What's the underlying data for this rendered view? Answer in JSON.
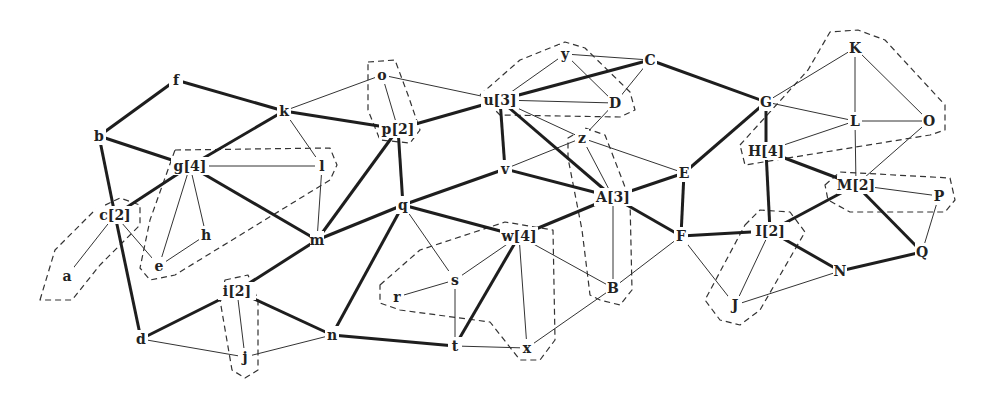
{
  "diagram": {
    "type": "graph",
    "nodes": [
      {
        "id": "f",
        "label": "f",
        "x": 176,
        "y": 80
      },
      {
        "id": "k",
        "label": "k",
        "x": 284,
        "y": 111
      },
      {
        "id": "b",
        "label": "b",
        "x": 99,
        "y": 136
      },
      {
        "id": "g",
        "label": "g[4]",
        "x": 190,
        "y": 166
      },
      {
        "id": "l",
        "label": "l",
        "x": 322,
        "y": 166
      },
      {
        "id": "c",
        "label": "c[2]",
        "x": 115,
        "y": 215
      },
      {
        "id": "h",
        "label": "h",
        "x": 206,
        "y": 235
      },
      {
        "id": "e",
        "label": "e",
        "x": 159,
        "y": 266
      },
      {
        "id": "a",
        "label": "a",
        "x": 67,
        "y": 276
      },
      {
        "id": "m",
        "label": "m",
        "x": 317,
        "y": 240
      },
      {
        "id": "i",
        "label": "i[2]",
        "x": 237,
        "y": 291
      },
      {
        "id": "d",
        "label": "d",
        "x": 141,
        "y": 339
      },
      {
        "id": "j",
        "label": "j",
        "x": 245,
        "y": 357
      },
      {
        "id": "n",
        "label": "n",
        "x": 332,
        "y": 335
      },
      {
        "id": "o",
        "label": "o",
        "x": 382,
        "y": 75
      },
      {
        "id": "p",
        "label": "p[2]",
        "x": 398,
        "y": 129
      },
      {
        "id": "q",
        "label": "q",
        "x": 403,
        "y": 205
      },
      {
        "id": "u",
        "label": "u[3]",
        "x": 500,
        "y": 100
      },
      {
        "id": "y",
        "label": "y",
        "x": 565,
        "y": 54
      },
      {
        "id": "C",
        "label": "C",
        "x": 650,
        "y": 60
      },
      {
        "id": "D",
        "label": "D",
        "x": 615,
        "y": 103
      },
      {
        "id": "z",
        "label": "z",
        "x": 582,
        "y": 138
      },
      {
        "id": "v",
        "label": "v",
        "x": 505,
        "y": 169
      },
      {
        "id": "A",
        "label": "A[3]",
        "x": 613,
        "y": 197
      },
      {
        "id": "E",
        "label": "E",
        "x": 684,
        "y": 173
      },
      {
        "id": "F",
        "label": "F",
        "x": 681,
        "y": 236
      },
      {
        "id": "w",
        "label": "w[4]",
        "x": 519,
        "y": 236
      },
      {
        "id": "s",
        "label": "s",
        "x": 455,
        "y": 280
      },
      {
        "id": "r",
        "label": "r",
        "x": 397,
        "y": 297
      },
      {
        "id": "t",
        "label": "t",
        "x": 455,
        "y": 346
      },
      {
        "id": "x",
        "label": "x",
        "x": 527,
        "y": 348
      },
      {
        "id": "B",
        "label": "B",
        "x": 613,
        "y": 288
      },
      {
        "id": "G",
        "label": "G",
        "x": 766,
        "y": 102
      },
      {
        "id": "K",
        "label": "K",
        "x": 855,
        "y": 48
      },
      {
        "id": "L",
        "label": "L",
        "x": 855,
        "y": 121
      },
      {
        "id": "O",
        "label": "O",
        "x": 929,
        "y": 121
      },
      {
        "id": "H",
        "label": "H[4]",
        "x": 766,
        "y": 151
      },
      {
        "id": "M",
        "label": "M[2]",
        "x": 856,
        "y": 185
      },
      {
        "id": "P",
        "label": "P",
        "x": 939,
        "y": 196
      },
      {
        "id": "I",
        "label": "I[2]",
        "x": 770,
        "y": 231
      },
      {
        "id": "Q",
        "label": "Q",
        "x": 922,
        "y": 252
      },
      {
        "id": "N",
        "label": "N",
        "x": 840,
        "y": 271
      },
      {
        "id": "J",
        "label": "J",
        "x": 735,
        "y": 305
      }
    ],
    "edges_thick": [
      [
        "f",
        "b"
      ],
      [
        "f",
        "k"
      ],
      [
        "b",
        "g"
      ],
      [
        "b",
        "c"
      ],
      [
        "k",
        "g"
      ],
      [
        "k",
        "p"
      ],
      [
        "g",
        "c"
      ],
      [
        "g",
        "m"
      ],
      [
        "c",
        "d"
      ],
      [
        "m",
        "i"
      ],
      [
        "m",
        "q"
      ],
      [
        "m",
        "p"
      ],
      [
        "i",
        "d"
      ],
      [
        "i",
        "n"
      ],
      [
        "n",
        "q"
      ],
      [
        "n",
        "t"
      ],
      [
        "p",
        "q"
      ],
      [
        "p",
        "u"
      ],
      [
        "q",
        "v"
      ],
      [
        "q",
        "w"
      ],
      [
        "u",
        "v"
      ],
      [
        "u",
        "A"
      ],
      [
        "u",
        "C"
      ],
      [
        "v",
        "A"
      ],
      [
        "w",
        "A"
      ],
      [
        "w",
        "t"
      ],
      [
        "A",
        "E"
      ],
      [
        "A",
        "F"
      ],
      [
        "E",
        "F"
      ],
      [
        "E",
        "G"
      ],
      [
        "C",
        "G"
      ],
      [
        "F",
        "I"
      ],
      [
        "G",
        "H"
      ],
      [
        "H",
        "I"
      ],
      [
        "H",
        "M"
      ],
      [
        "M",
        "I"
      ],
      [
        "M",
        "Q"
      ],
      [
        "I",
        "N"
      ],
      [
        "N",
        "Q"
      ]
    ],
    "edges_thin": [
      [
        "k",
        "o"
      ],
      [
        "k",
        "l"
      ],
      [
        "g",
        "l"
      ],
      [
        "g",
        "h"
      ],
      [
        "g",
        "e"
      ],
      [
        "c",
        "a"
      ],
      [
        "c",
        "e"
      ],
      [
        "e",
        "h"
      ],
      [
        "l",
        "m"
      ],
      [
        "d",
        "j"
      ],
      [
        "i",
        "j"
      ],
      [
        "j",
        "n"
      ],
      [
        "o",
        "p"
      ],
      [
        "o",
        "u"
      ],
      [
        "u",
        "y"
      ],
      [
        "u",
        "D"
      ],
      [
        "u",
        "z"
      ],
      [
        "y",
        "C"
      ],
      [
        "y",
        "D"
      ],
      [
        "C",
        "D"
      ],
      [
        "D",
        "z"
      ],
      [
        "z",
        "v"
      ],
      [
        "z",
        "A"
      ],
      [
        "z",
        "E"
      ],
      [
        "q",
        "s"
      ],
      [
        "s",
        "w"
      ],
      [
        "s",
        "r"
      ],
      [
        "s",
        "t"
      ],
      [
        "t",
        "x"
      ],
      [
        "w",
        "x"
      ],
      [
        "w",
        "B"
      ],
      [
        "A",
        "B"
      ],
      [
        "B",
        "F"
      ],
      [
        "B",
        "x"
      ],
      [
        "F",
        "J"
      ],
      [
        "I",
        "J"
      ],
      [
        "J",
        "N"
      ],
      [
        "G",
        "K"
      ],
      [
        "G",
        "L"
      ],
      [
        "H",
        "L"
      ],
      [
        "K",
        "L"
      ],
      [
        "K",
        "O"
      ],
      [
        "L",
        "O"
      ],
      [
        "L",
        "M"
      ],
      [
        "O",
        "M"
      ],
      [
        "M",
        "P"
      ],
      [
        "P",
        "Q"
      ]
    ],
    "clusters": [
      {
        "name": "cluster-a-c",
        "members": [
          "a",
          "c"
        ],
        "points": "40,300 55,250 95,210 120,198 140,205 140,225 100,265 72,300"
      },
      {
        "name": "cluster-g",
        "members": [
          "g",
          "e",
          "h",
          "l"
        ],
        "points": "175,150 330,148 337,165 330,180 175,275 150,280 140,268 150,220"
      },
      {
        "name": "cluster-i-j",
        "members": [
          "i",
          "j"
        ],
        "points": "225,280 248,275 258,300 258,370 245,378 232,370 220,300"
      },
      {
        "name": "cluster-o-p",
        "members": [
          "o",
          "p"
        ],
        "points": "368,62 395,60 408,95 420,130 410,143 380,140 368,110"
      },
      {
        "name": "cluster-u",
        "members": [
          "u",
          "y",
          "D"
        ],
        "points": "480,95 520,60 565,42 585,48 630,92 635,110 620,117 500,115"
      },
      {
        "name": "cluster-w",
        "members": [
          "w",
          "r",
          "s",
          "x"
        ],
        "points": "380,285 420,250 505,222 553,230 555,340 540,360 520,360 490,322 400,310 380,303"
      },
      {
        "name": "cluster-A",
        "members": [
          "A",
          "z",
          "B"
        ],
        "points": "568,138 585,128 605,135 630,200 632,290 620,305 600,300 590,295 582,230 568,158"
      },
      {
        "name": "cluster-H",
        "members": [
          "H",
          "K",
          "O"
        ],
        "points": "740,145 808,70 830,32 858,30 885,40 945,105 945,130 930,135 745,165"
      },
      {
        "name": "cluster-M",
        "members": [
          "M",
          "P"
        ],
        "points": "825,185 840,172 950,178 955,200 945,212 850,212 828,200"
      },
      {
        "name": "cluster-I-J",
        "members": [
          "I",
          "J"
        ],
        "points": "745,225 760,210 790,212 805,232 760,310 740,325 720,320 705,300"
      }
    ]
  }
}
